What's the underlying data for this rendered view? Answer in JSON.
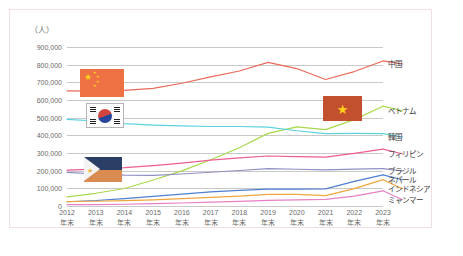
{
  "axis_unit_label": "（人）",
  "border_color": "#f3dfe3",
  "y_axis": {
    "ticks": [
      "900,000",
      "800,000",
      "700,000",
      "600,000",
      "500,000",
      "400,000",
      "300,000",
      "200,000",
      "100,000",
      "0"
    ],
    "min": 0,
    "max": 900000,
    "step": 100000
  },
  "x_axis": {
    "suffix": "年末",
    "categories": [
      "2012",
      "2013",
      "2014",
      "2015",
      "2016",
      "2017",
      "2018",
      "2019",
      "2020",
      "2021",
      "2022",
      "2023"
    ]
  },
  "flags": [
    {
      "name": "china-flag",
      "label": "中国"
    },
    {
      "name": "south-korea-flag",
      "label": "韓国"
    },
    {
      "name": "philippines-flag",
      "label": "フィリピン"
    },
    {
      "name": "vietnam-flag",
      "label": "ベトナム"
    }
  ],
  "series_labels": {
    "china": "中国",
    "vietnam": "ベトナム",
    "korea": "韓国",
    "philippines": "フィリピン",
    "brazil": "ブラジル",
    "nepal": "ネパール",
    "indonesia": "インドネシア",
    "myanmar": "ミャンマー"
  },
  "chart_data": {
    "type": "line",
    "title": "",
    "xlabel": "",
    "ylabel": "（人）",
    "ylim": [
      0,
      900000
    ],
    "grid": true,
    "legend_position": "right-inline",
    "x": [
      "2012年末",
      "2013年末",
      "2014年末",
      "2015年末",
      "2016年末",
      "2017年末",
      "2018年末",
      "2019年末",
      "2020年末",
      "2021年末",
      "2022年末",
      "2023年末"
    ],
    "series": [
      {
        "name": "中国",
        "color": "#ea6a5a",
        "values": [
          652000,
          650000,
          654000,
          666000,
          695000,
          731000,
          764000,
          813000,
          778000,
          716000,
          761000,
          821000
        ]
      },
      {
        "name": "ベトナム",
        "color": "#a8d84b",
        "values": [
          52000,
          72000,
          99000,
          147000,
          199000,
          262000,
          330000,
          411000,
          448000,
          432000,
          489000,
          565000
        ]
      },
      {
        "name": "韓国",
        "color": "#5ad2e0",
        "values": [
          490000,
          481000,
          466000,
          458000,
          453000,
          450000,
          450000,
          446000,
          426000,
          410000,
          411000,
          410000
        ]
      },
      {
        "name": "フィリピン",
        "color": "#ee5d94",
        "values": [
          203000,
          209000,
          217000,
          229000,
          243000,
          260000,
          272000,
          283000,
          280000,
          277000,
          298000,
          322000
        ]
      },
      {
        "name": "ブラジル",
        "color": "#8f8fc4",
        "values": [
          190000,
          181000,
          175000,
          173000,
          181000,
          191000,
          201000,
          211000,
          208000,
          204000,
          209000,
          212000
        ]
      },
      {
        "name": "ネパール",
        "color": "#4f7fd0",
        "values": [
          24000,
          31000,
          42000,
          54000,
          67000,
          80000,
          89000,
          96000,
          96000,
          97000,
          139000,
          176000
        ]
      },
      {
        "name": "インドネシア",
        "color": "#f0a63c",
        "values": [
          25000,
          27000,
          30000,
          35000,
          42000,
          49000,
          56000,
          66000,
          66000,
          59000,
          98000,
          149000
        ]
      },
      {
        "name": "ミャンマー",
        "color": "#e67fc4",
        "values": [
          8000,
          8000,
          10000,
          13000,
          17000,
          22000,
          26000,
          32000,
          35000,
          37000,
          56000,
          86000
        ]
      }
    ]
  }
}
